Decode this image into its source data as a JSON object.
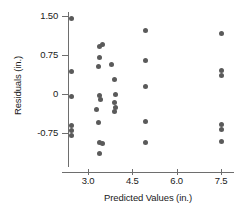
{
  "chart_data": {
    "type": "scatter",
    "title": "",
    "xlabel": "Predicted Values (in.)",
    "ylabel": "Residuals (in.)",
    "xticks": [
      3.0,
      4.5,
      6.0,
      7.5
    ],
    "xtick_labels": [
      "3.0",
      "4.5",
      "6.0",
      "7.5"
    ],
    "yticks": [
      1.5,
      0.75,
      0,
      -0.75
    ],
    "ytick_labels": [
      "1.50",
      "0.75",
      "0",
      "-0.75"
    ],
    "xlim": [
      2.25,
      8.0
    ],
    "ylim": [
      -1.35,
      1.72
    ],
    "grid": false,
    "legend": null,
    "marker_color": "#5a5a5a",
    "axis_color": "#6e6e6e",
    "points": [
      {
        "x": 2.45,
        "y": 1.45
      },
      {
        "x": 2.45,
        "y": 0.44
      },
      {
        "x": 2.45,
        "y": -0.04
      },
      {
        "x": 2.45,
        "y": -0.6
      },
      {
        "x": 2.45,
        "y": -0.7
      },
      {
        "x": 2.45,
        "y": -0.8
      },
      {
        "x": 3.38,
        "y": 0.92
      },
      {
        "x": 3.48,
        "y": 0.95
      },
      {
        "x": 3.4,
        "y": 0.71
      },
      {
        "x": 3.35,
        "y": 0.53
      },
      {
        "x": 3.8,
        "y": 0.57
      },
      {
        "x": 3.88,
        "y": 0.28
      },
      {
        "x": 3.4,
        "y": -0.02
      },
      {
        "x": 3.42,
        "y": -0.1
      },
      {
        "x": 3.92,
        "y": -0.01
      },
      {
        "x": 3.9,
        "y": -0.16
      },
      {
        "x": 3.92,
        "y": -0.26
      },
      {
        "x": 3.9,
        "y": -0.33
      },
      {
        "x": 3.28,
        "y": -0.3
      },
      {
        "x": 3.35,
        "y": -0.54
      },
      {
        "x": 3.4,
        "y": -0.93
      },
      {
        "x": 3.48,
        "y": -0.96
      },
      {
        "x": 3.38,
        "y": -1.15
      },
      {
        "x": 4.95,
        "y": 1.22
      },
      {
        "x": 4.95,
        "y": 0.65
      },
      {
        "x": 4.95,
        "y": 0.14
      },
      {
        "x": 4.95,
        "y": -0.52
      },
      {
        "x": 4.95,
        "y": -0.93
      },
      {
        "x": 7.52,
        "y": 1.17
      },
      {
        "x": 7.52,
        "y": 0.45
      },
      {
        "x": 7.52,
        "y": 0.36
      },
      {
        "x": 7.52,
        "y": -0.58
      },
      {
        "x": 7.52,
        "y": -0.68
      },
      {
        "x": 7.52,
        "y": -0.92
      }
    ]
  }
}
